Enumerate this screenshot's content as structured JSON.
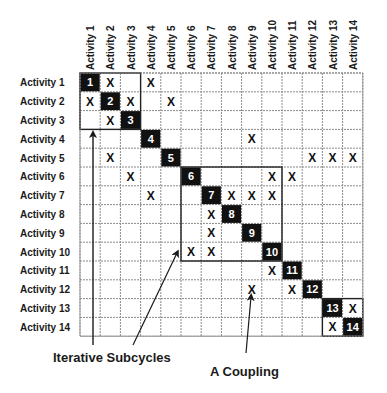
{
  "diagram": {
    "type": "design-structure-matrix",
    "activities": [
      "Activity 1",
      "Activity 2",
      "Activity 3",
      "Activity 4",
      "Activity 5",
      "Activity 6",
      "Activity 7",
      "Activity 8",
      "Activity 9",
      "Activity 10",
      "Activity 11",
      "Activity 12",
      "Activity 13",
      "Activity 14"
    ],
    "diagonal_labels": [
      "1",
      "2",
      "3",
      "4",
      "5",
      "6",
      "7",
      "8",
      "9",
      "10",
      "11",
      "12",
      "13",
      "14"
    ],
    "mark_symbol": "X",
    "marks": [
      {
        "row": 1,
        "col": 2
      },
      {
        "row": 1,
        "col": 4
      },
      {
        "row": 2,
        "col": 1
      },
      {
        "row": 2,
        "col": 3
      },
      {
        "row": 2,
        "col": 5
      },
      {
        "row": 3,
        "col": 2
      },
      {
        "row": 4,
        "col": 9
      },
      {
        "row": 5,
        "col": 2
      },
      {
        "row": 5,
        "col": 12
      },
      {
        "row": 5,
        "col": 13
      },
      {
        "row": 5,
        "col": 14
      },
      {
        "row": 6,
        "col": 3
      },
      {
        "row": 6,
        "col": 10
      },
      {
        "row": 6,
        "col": 11
      },
      {
        "row": 7,
        "col": 4
      },
      {
        "row": 7,
        "col": 8
      },
      {
        "row": 7,
        "col": 9
      },
      {
        "row": 7,
        "col": 10
      },
      {
        "row": 8,
        "col": 7
      },
      {
        "row": 9,
        "col": 7
      },
      {
        "row": 10,
        "col": 6
      },
      {
        "row": 10,
        "col": 7
      },
      {
        "row": 11,
        "col": 10
      },
      {
        "row": 12,
        "col": 9
      },
      {
        "row": 12,
        "col": 11
      },
      {
        "row": 13,
        "col": 14
      },
      {
        "row": 14,
        "col": 13
      }
    ],
    "blocks": [
      {
        "from": 1,
        "to": 3
      },
      {
        "from": 6,
        "to": 10
      },
      {
        "from": 13,
        "to": 14
      }
    ],
    "annotations": {
      "iterative_subcycles": "Iterative Subcycles",
      "coupling": "A Coupling"
    },
    "colors": {
      "diagonal_fill": "#111111",
      "diagonal_text": "#ffffff",
      "grid_line": "#8a8a8a",
      "block_border": "#222222",
      "text": "#1a1a1a"
    }
  }
}
